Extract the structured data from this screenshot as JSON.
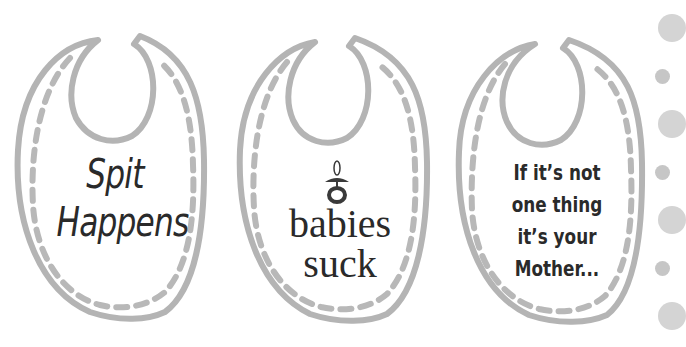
{
  "image": {
    "description": "Three baby bib outline illustrations with humorous slogans, decorative dots on right edge",
    "colors": {
      "background": "#ffffff",
      "bib_outline": "#b4b4b4",
      "text": "#2a2a2a",
      "dot_large": "#d6d6d6",
      "dot_small": "#c4c4c4"
    }
  },
  "bibs": [
    {
      "name": "bib-spit-happens",
      "lines": [
        "Spit",
        "Happens"
      ]
    },
    {
      "name": "bib-babies-suck",
      "icon": "pacifier-icon",
      "lines": [
        "babies",
        "suck"
      ]
    },
    {
      "name": "bib-mother",
      "lines": [
        "If it’s not",
        "one thing",
        "it’s your",
        "Mother..."
      ]
    }
  ],
  "dots": [
    {
      "size": "large",
      "cx": 667,
      "cy": 28
    },
    {
      "size": "small",
      "cx": 662,
      "cy": 76
    },
    {
      "size": "large",
      "cx": 667,
      "cy": 124
    },
    {
      "size": "small",
      "cx": 662,
      "cy": 172
    },
    {
      "size": "large",
      "cx": 667,
      "cy": 220
    },
    {
      "size": "small",
      "cx": 662,
      "cy": 268
    },
    {
      "size": "large",
      "cx": 667,
      "cy": 316
    }
  ]
}
